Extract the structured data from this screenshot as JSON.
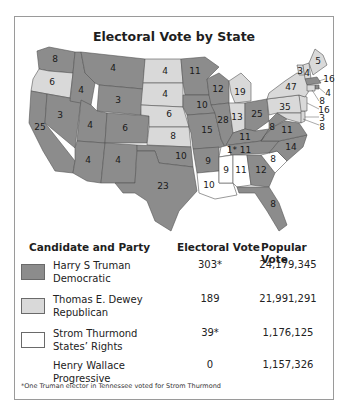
{
  "title": "Electoral Vote by State",
  "colors": {
    "democratic": "#8c8c8c",
    "republican": "#d9d9d9",
    "states_rights": "#ffffff",
    "border": "#555555",
    "frame": "#9a9a9a"
  },
  "map": {
    "states": [
      {
        "abbr": "WA",
        "ev": "8",
        "party": "democratic"
      },
      {
        "abbr": "OR",
        "ev": "6",
        "party": "republican"
      },
      {
        "abbr": "CA",
        "ev": "25",
        "party": "democratic"
      },
      {
        "abbr": "NV",
        "ev": "3",
        "party": "democratic"
      },
      {
        "abbr": "ID",
        "ev": "4",
        "party": "democratic"
      },
      {
        "abbr": "MT",
        "ev": "4",
        "party": "democratic"
      },
      {
        "abbr": "WY",
        "ev": "3",
        "party": "democratic"
      },
      {
        "abbr": "UT",
        "ev": "4",
        "party": "democratic"
      },
      {
        "abbr": "CO",
        "ev": "6",
        "party": "democratic"
      },
      {
        "abbr": "AZ",
        "ev": "4",
        "party": "democratic"
      },
      {
        "abbr": "NM",
        "ev": "4",
        "party": "democratic"
      },
      {
        "abbr": "ND",
        "ev": "4",
        "party": "republican"
      },
      {
        "abbr": "SD",
        "ev": "4",
        "party": "republican"
      },
      {
        "abbr": "NE",
        "ev": "6",
        "party": "republican"
      },
      {
        "abbr": "KS",
        "ev": "8",
        "party": "republican"
      },
      {
        "abbr": "OK",
        "ev": "10",
        "party": "democratic"
      },
      {
        "abbr": "TX",
        "ev": "23",
        "party": "democratic"
      },
      {
        "abbr": "MN",
        "ev": "11",
        "party": "democratic"
      },
      {
        "abbr": "IA",
        "ev": "10",
        "party": "democratic"
      },
      {
        "abbr": "MO",
        "ev": "15",
        "party": "democratic"
      },
      {
        "abbr": "AR",
        "ev": "9",
        "party": "democratic"
      },
      {
        "abbr": "LA",
        "ev": "10",
        "party": "states_rights"
      },
      {
        "abbr": "WI",
        "ev": "12",
        "party": "democratic"
      },
      {
        "abbr": "IL",
        "ev": "28",
        "party": "democratic"
      },
      {
        "abbr": "MI",
        "ev": "19",
        "party": "republican"
      },
      {
        "abbr": "IN",
        "ev": "13",
        "party": "republican"
      },
      {
        "abbr": "OH",
        "ev": "25",
        "party": "democratic"
      },
      {
        "abbr": "KY",
        "ev": "11",
        "party": "democratic"
      },
      {
        "abbr": "TN",
        "ev": "1* 11",
        "party": "democratic"
      },
      {
        "abbr": "MS",
        "ev": "9",
        "party": "states_rights"
      },
      {
        "abbr": "AL",
        "ev": "11",
        "party": "states_rights"
      },
      {
        "abbr": "GA",
        "ev": "12",
        "party": "democratic"
      },
      {
        "abbr": "FL",
        "ev": "8",
        "party": "democratic"
      },
      {
        "abbr": "SC",
        "ev": "8",
        "party": "states_rights"
      },
      {
        "abbr": "NC",
        "ev": "14",
        "party": "democratic"
      },
      {
        "abbr": "VA",
        "ev": "11",
        "party": "democratic"
      },
      {
        "abbr": "WV",
        "ev": "8",
        "party": "democratic"
      },
      {
        "abbr": "PA",
        "ev": "35",
        "party": "republican"
      },
      {
        "abbr": "NY",
        "ev": "47",
        "party": "republican"
      },
      {
        "abbr": "VT",
        "ev": "3",
        "party": "republican"
      },
      {
        "abbr": "NH",
        "ev": "4",
        "party": "republican"
      },
      {
        "abbr": "ME",
        "ev": "5",
        "party": "republican"
      },
      {
        "abbr": "MA",
        "ev": "16",
        "party": "democratic"
      },
      {
        "abbr": "RI",
        "ev": "4",
        "party": "democratic"
      },
      {
        "abbr": "CT",
        "ev": "8",
        "party": "republican"
      },
      {
        "abbr": "NJ",
        "ev": "16",
        "party": "republican"
      },
      {
        "abbr": "DE",
        "ev": "3",
        "party": "republican"
      },
      {
        "abbr": "MD",
        "ev": "8",
        "party": "republican"
      }
    ]
  },
  "legend": {
    "headers": {
      "candidate": "Candidate and Party",
      "electoral": "Electoral Vote",
      "popular": "Popular Vote"
    },
    "rows": [
      {
        "name": "Harry S Truman",
        "party": "Democratic",
        "electoral": "303*",
        "popular": "24,179,345",
        "swatch": "democratic"
      },
      {
        "name": "Thomas E. Dewey",
        "party": "Republican",
        "electoral": "189",
        "popular": "21,991,291",
        "swatch": "republican"
      },
      {
        "name": "Strom Thurmond",
        "party": "States’ Rights",
        "electoral": "39*",
        "popular": "1,176,125",
        "swatch": "states_rights"
      },
      {
        "name": "Henry Wallace",
        "party": "Progressive",
        "electoral": "0",
        "popular": "1,157,326",
        "swatch": "none"
      }
    ]
  },
  "footnote": "*One Truman elector in Tennessee voted for Strom Thurmond"
}
